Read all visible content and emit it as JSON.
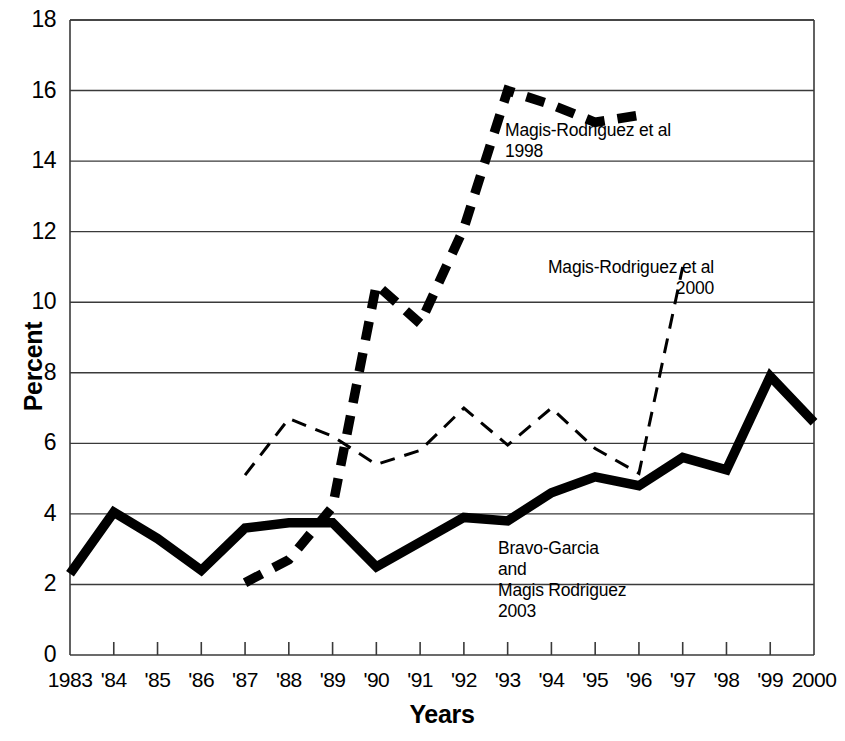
{
  "chart_data": {
    "type": "line",
    "title": "",
    "xlabel": "Years",
    "ylabel": "Percent",
    "xlim": [
      1983,
      2000
    ],
    "ylim": [
      0,
      18
    ],
    "ytick_values": [
      0,
      2,
      4,
      6,
      8,
      10,
      12,
      14,
      16,
      18
    ],
    "ytick_labels": [
      "0",
      "2",
      "4",
      "6",
      "8",
      "10",
      "12",
      "14",
      "16",
      "18"
    ],
    "xtick_values": [
      1983,
      1984,
      1985,
      1986,
      1987,
      1988,
      1989,
      1990,
      1991,
      1992,
      1993,
      1994,
      1995,
      1996,
      1997,
      1998,
      1999,
      2000
    ],
    "xtick_labels": [
      "1983",
      "'84",
      "'85",
      "'86",
      "'87",
      "'88",
      "'89",
      "'90",
      "'91",
      "'92",
      "'93",
      "'94",
      "'95",
      "'96",
      "'97",
      "'98",
      "'99",
      "2000"
    ],
    "grid": "horizontal",
    "legend": "inline-annotations",
    "series": [
      {
        "name": "Magis-Rodriguez et al 1998",
        "style": "thick-dashed",
        "color": "#000000",
        "x": [
          1987,
          1988,
          1989,
          1990,
          1991,
          1992,
          1993,
          1994,
          1995,
          1996
        ],
        "values": [
          2.05,
          2.7,
          4.2,
          10.5,
          9.4,
          12.1,
          16.0,
          15.6,
          15.1,
          15.3
        ]
      },
      {
        "name": "Magis-Rodriguez et al 2000",
        "style": "thin-dashed",
        "color": "#000000",
        "x": [
          1987,
          1988,
          1989,
          1990,
          1991,
          1992,
          1993,
          1994,
          1995,
          1996,
          1997
        ],
        "values": [
          5.1,
          6.7,
          6.2,
          5.4,
          5.8,
          7.0,
          5.95,
          7.0,
          5.85,
          5.15,
          11.0
        ]
      },
      {
        "name": "Bravo-Garcia and Magis Rodriguez 2003",
        "style": "thick-solid",
        "color": "#000000",
        "x": [
          1983,
          1984,
          1985,
          1986,
          1987,
          1988,
          1989,
          1990,
          1991,
          1992,
          1993,
          1994,
          1995,
          1996,
          1997,
          1998,
          1999,
          2000
        ],
        "values": [
          2.3,
          4.05,
          3.3,
          2.4,
          3.6,
          3.75,
          3.75,
          2.5,
          3.2,
          3.9,
          3.8,
          4.6,
          5.05,
          4.8,
          5.6,
          5.25,
          7.9,
          6.6
        ]
      }
    ],
    "annotations": [
      {
        "id": "magis-1998",
        "text": "Magis-Rodriguez et al\n1998",
        "align": "left"
      },
      {
        "id": "magis-2000",
        "text": "Magis-Rodriguez et al\n2000",
        "align": "right"
      },
      {
        "id": "bravo-2003",
        "text": "Bravo-Garcia\nand\nMagis Rodriguez\n2003",
        "align": "left"
      }
    ]
  }
}
